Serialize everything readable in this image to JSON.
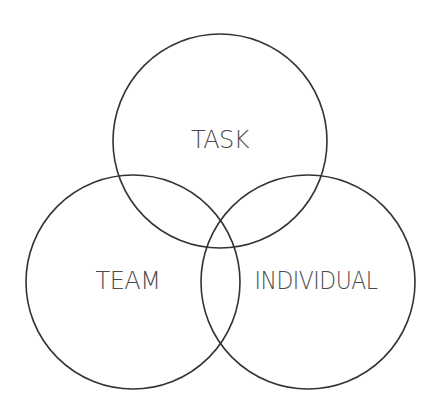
{
  "diagram": {
    "type": "venn",
    "stroke_color": "#333333",
    "text_color": "#4a4a4a",
    "circles": [
      {
        "id": "task",
        "label": "TASK",
        "cx": 220,
        "cy": 141,
        "r": 107
      },
      {
        "id": "team",
        "label": "TEAM",
        "cx": 133,
        "cy": 282,
        "r": 107
      },
      {
        "id": "individual",
        "label": "INDIVIDUAL",
        "cx": 308,
        "cy": 282,
        "r": 107
      }
    ]
  }
}
